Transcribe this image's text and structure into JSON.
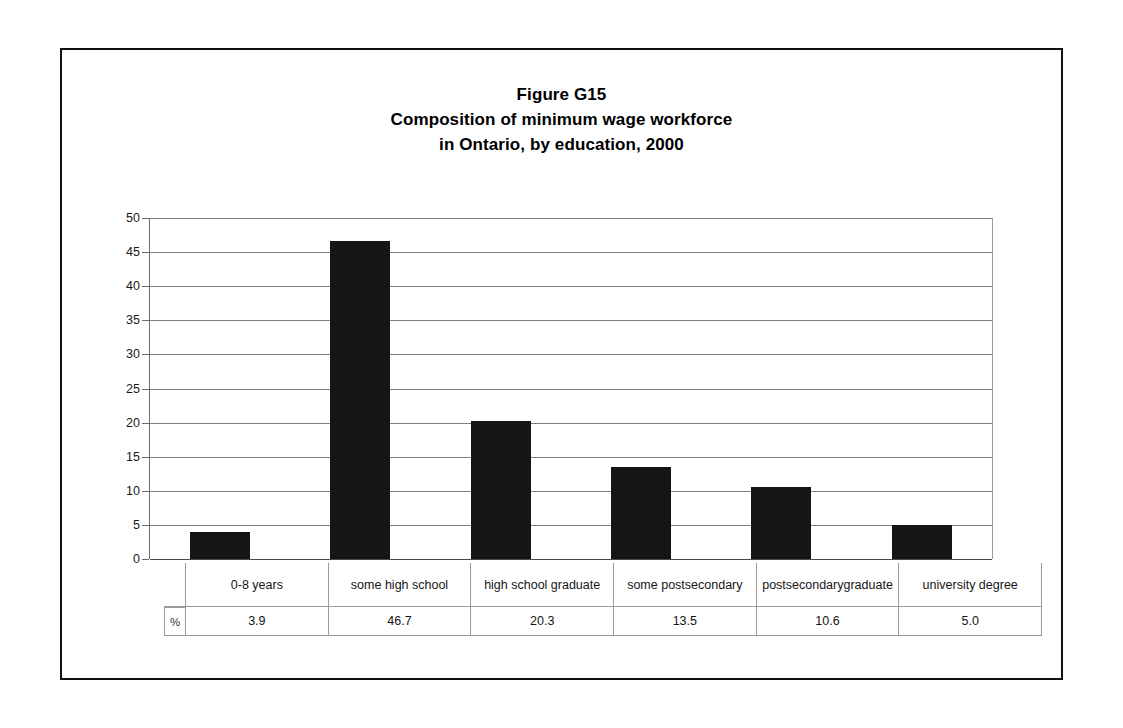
{
  "chart_data": {
    "type": "bar",
    "title": "Figure G15 Composition of minimum wage workforce in Ontario, by education, 2000",
    "title_lines": [
      "Figure G15",
      "Composition of minimum wage workforce",
      "in Ontario, by education, 2000"
    ],
    "categories": [
      "0-8 years",
      "some high school",
      "high school graduate",
      "some postsecondary",
      "postsecondary graduate",
      "university degree"
    ],
    "category_lines": [
      [
        "0-8 years"
      ],
      [
        "some high school"
      ],
      [
        "high school graduate"
      ],
      [
        "some postsecondary"
      ],
      [
        "postsecondary",
        "graduate"
      ],
      [
        "university degree"
      ]
    ],
    "values": [
      3.9,
      46.7,
      20.3,
      13.5,
      10.6,
      5.0
    ],
    "value_labels": [
      "3.9",
      "46.7",
      "20.3",
      "13.5",
      "10.6",
      "5.0"
    ],
    "series_label": "%",
    "xlabel": "",
    "ylabel": "",
    "ylim": [
      0,
      50
    ],
    "ytick_step": 5,
    "yticks": [
      0,
      5,
      10,
      15,
      20,
      25,
      30,
      35,
      40,
      45,
      50
    ],
    "ytick_labels": [
      "0",
      "5",
      "10",
      "15",
      "20",
      "25",
      "30",
      "35",
      "40",
      "45",
      "50"
    ],
    "grid": true,
    "grid_axis": "y",
    "legend": false,
    "legend_position": "none",
    "bar_color": "#151515",
    "gridline_color": "#7e7e7e",
    "axis_color": "#4a4a4a",
    "background_color": "#ffffff",
    "data_table_visible": true
  }
}
